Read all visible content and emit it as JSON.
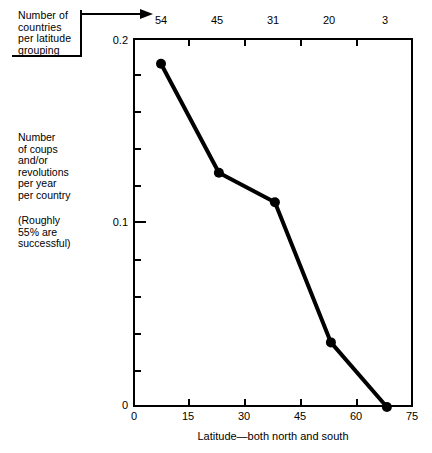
{
  "chart_data": {
    "type": "line",
    "title": "",
    "xlabel": "Latitude—both north and south",
    "ylabel": "Number\nof coups\nand/or\nrevolutions\nper year\nper country",
    "ylabel_note": "(Roughly\n55% are\nsuccessful)",
    "x": [
      7.5,
      23,
      38,
      53,
      68
    ],
    "values": [
      0.186,
      0.127,
      0.111,
      0.035,
      0.0
    ],
    "xlim": [
      0,
      75
    ],
    "ylim": [
      0,
      0.2
    ],
    "grid": false,
    "legend": "none",
    "marker": "filled-circle",
    "x_ticks": [
      "0",
      "15",
      "30",
      "45",
      "60",
      "75"
    ],
    "x_tick_values": [
      0,
      15,
      30,
      45,
      60,
      75
    ],
    "y_ticks": [
      "0",
      "0.1",
      "0.2"
    ],
    "y_tick_values": [
      0,
      0.1,
      0.2
    ],
    "y_minor_tick_values": [
      0.02,
      0.04,
      0.06,
      0.08,
      0.12,
      0.14,
      0.16,
      0.18
    ],
    "top_axis": {
      "label": "Number of\ncountries\nper latitude\ngrouping",
      "tick_labels": [
        "54",
        "45",
        "31",
        "20",
        "3"
      ],
      "group_boundaries": [
        0,
        15,
        30,
        45,
        60,
        75
      ],
      "group_centers": [
        7.5,
        22.5,
        37.5,
        52.5,
        67.5
      ]
    },
    "colors": {
      "line": "#000000",
      "marker": "#000000",
      "axis": "#000000",
      "background": "#ffffff"
    }
  }
}
